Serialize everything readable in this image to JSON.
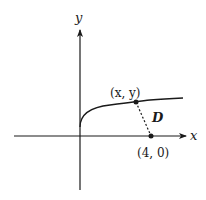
{
  "diagram": {
    "axes": {
      "x_label": "x",
      "y_label": "y"
    },
    "curve": {
      "description": "square-root-like curve starting at origin"
    },
    "points": [
      {
        "label": "(x, y)",
        "role": "point-on-curve"
      },
      {
        "label": "(4, 0)",
        "role": "point-on-x-axis"
      }
    ],
    "distance_label": "D",
    "colors": {
      "ink": "#1a1a1a",
      "background": "#ffffff"
    }
  }
}
